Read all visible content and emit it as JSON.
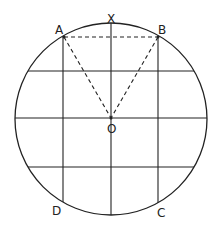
{
  "diagram": {
    "labels": {
      "A": "A",
      "B": "B",
      "X": "X",
      "O": "O",
      "C": "C",
      "D": "D"
    },
    "circle": {
      "cx": 111,
      "cy": 119,
      "r": 96
    },
    "stroke_color": "#222222"
  }
}
